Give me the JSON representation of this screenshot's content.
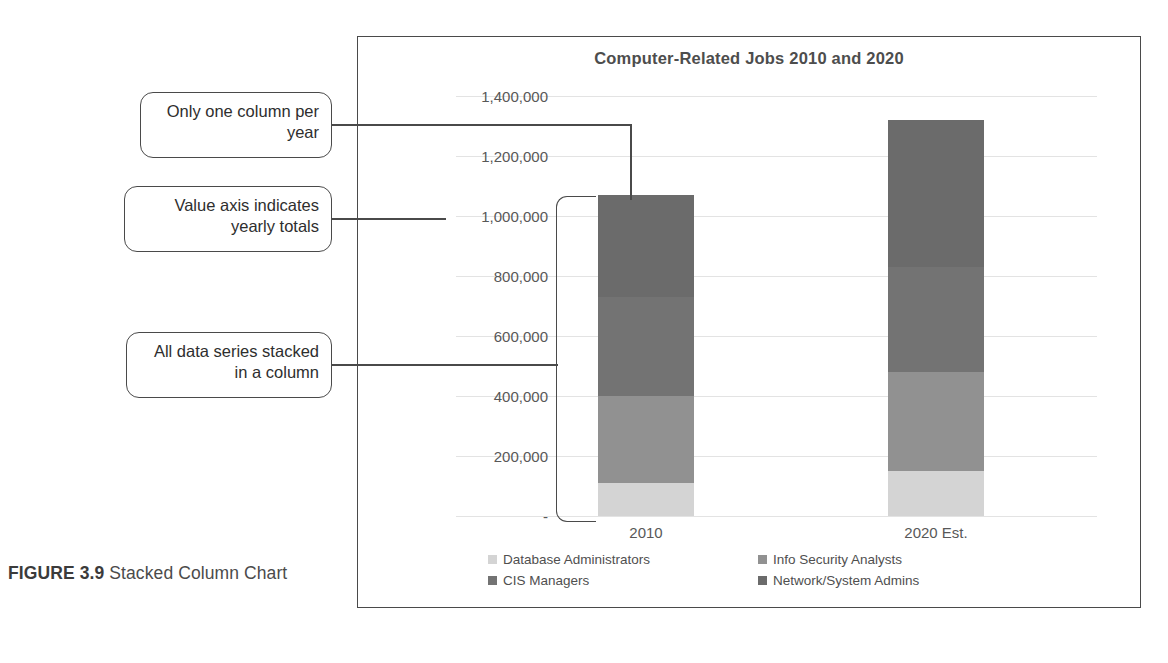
{
  "figure": {
    "label": "FIGURE 3.9",
    "caption": "Stacked Column Chart"
  },
  "callouts": [
    {
      "id": "one-column",
      "text": "Only one column per year"
    },
    {
      "id": "value-axis",
      "text": "Value axis indicates yearly totals"
    },
    {
      "id": "stacked",
      "text": "All data series stacked in a column"
    }
  ],
  "chart_data": {
    "type": "bar",
    "stacked": true,
    "title": "Computer-Related Jobs 2010 and 2020",
    "xlabel": "",
    "ylabel": "",
    "categories": [
      "2010",
      "2020 Est."
    ],
    "ylim": [
      0,
      1400000
    ],
    "yticks": [
      0,
      200000,
      400000,
      600000,
      800000,
      1000000,
      1200000,
      1400000
    ],
    "ytick_labels": [
      "-",
      "200,000",
      "400,000",
      "600,000",
      "800,000",
      "1,000,000",
      "1,200,000",
      "1,400,000"
    ],
    "grid": true,
    "legend_position": "bottom",
    "series": [
      {
        "name": "Database Administrators",
        "color": "#d4d4d4",
        "values": [
          110000,
          150000
        ]
      },
      {
        "name": "Info Security Analysts",
        "color": "#919191",
        "values": [
          290000,
          330000
        ]
      },
      {
        "name": "CIS Managers",
        "color": "#737373",
        "values": [
          330000,
          350000
        ]
      },
      {
        "name": "Network/System Admins",
        "color": "#6b6b6b",
        "values": [
          340000,
          490000
        ]
      }
    ],
    "totals": [
      1070000,
      1320000
    ]
  }
}
